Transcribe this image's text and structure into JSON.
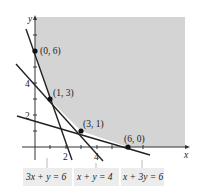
{
  "diagram": {
    "axes": {
      "x_label": "x",
      "y_label": "y",
      "x_ticks": [
        "2",
        "4"
      ],
      "y_ticks": [
        "2",
        "4"
      ]
    },
    "vertices": [
      {
        "label": "(0, 6)",
        "x": 0,
        "y": 6
      },
      {
        "label": "(1, 3)",
        "x": 1,
        "y": 3
      },
      {
        "label": "(3, 1)",
        "x": 3,
        "y": 1
      },
      {
        "label": "(6, 0)",
        "x": 6,
        "y": 0
      }
    ],
    "lines": [
      {
        "equation": "3x + y = 6"
      },
      {
        "equation": "x + y = 4"
      },
      {
        "equation": "x + 3y = 6"
      }
    ],
    "colors": {
      "shading": "#d4d4d4",
      "line": "#222222",
      "label_box": "#ececec"
    }
  }
}
